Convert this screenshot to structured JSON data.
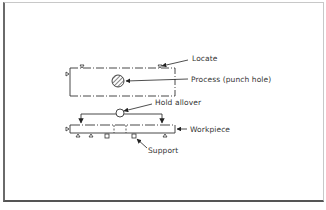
{
  "diagram": {
    "type": "fixture-principle-schematic",
    "labels": {
      "locate": "Locate",
      "process": "Process (punch hole)",
      "hold": "Hold allover",
      "workpiece": "Workpiece",
      "support": "Support"
    },
    "caption": {
      "visible": "partially cut off at bottom edge",
      "text": ""
    },
    "colors": {
      "line": "#333333",
      "background": "#ffffff",
      "frame": "#6a6a6a"
    }
  }
}
